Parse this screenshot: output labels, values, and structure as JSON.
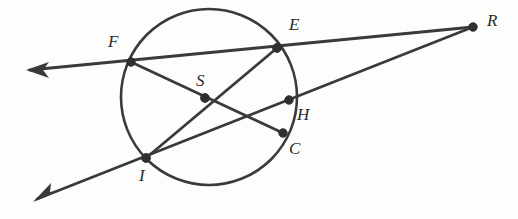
{
  "diagram": {
    "background_color": "#fdfdfc",
    "stroke_color": "#3a3a3a",
    "label_color": "#2b2b2b",
    "circle": {
      "name": "circle-S",
      "center_x": 209,
      "center_y": 97,
      "radius": 88
    },
    "points": [
      {
        "id": "F",
        "label": "F",
        "x": 131,
        "y": 62,
        "label_x": 108,
        "label_y": 33,
        "role": "circle-point"
      },
      {
        "id": "E",
        "label": "E",
        "x": 277,
        "y": 48,
        "label_x": 289,
        "label_y": 16,
        "role": "circle-point"
      },
      {
        "id": "R",
        "label": "R",
        "x": 473,
        "y": 27,
        "label_x": 487,
        "label_y": 12,
        "role": "external-point"
      },
      {
        "id": "S",
        "label": "S",
        "x": 205,
        "y": 98,
        "label_x": 196,
        "label_y": 72,
        "role": "intersection-point"
      },
      {
        "id": "H",
        "label": "H",
        "x": 289,
        "y": 100,
        "label_x": 297,
        "label_y": 106,
        "role": "circle-point"
      },
      {
        "id": "C",
        "label": "C",
        "x": 283,
        "y": 133,
        "label_x": 289,
        "label_y": 140,
        "role": "circle-point"
      },
      {
        "id": "I",
        "label": "I",
        "x": 146,
        "y": 158,
        "label_x": 139,
        "label_y": 167,
        "role": "circle-point"
      }
    ],
    "segments": [
      {
        "name": "secant-F-E-R",
        "from": "arrow-upper-left",
        "through": [
          "F",
          "E"
        ],
        "to": "R"
      },
      {
        "name": "secant-I-H-R",
        "from": "arrow-lower-left",
        "through": [
          "I",
          "H"
        ],
        "to": "R"
      },
      {
        "name": "chord-E-S-I",
        "from": "E",
        "through": [
          "S"
        ],
        "to": "I"
      },
      {
        "name": "chord-F-S-C",
        "from": "F",
        "through": [
          "S"
        ],
        "to": "C"
      }
    ],
    "arrows": [
      {
        "name": "arrow-upper-left",
        "tip_x": 26,
        "tip_y": 70,
        "angle_deg": 186
      },
      {
        "name": "arrow-lower-left",
        "tip_x": 33,
        "tip_y": 202,
        "angle_deg": 208
      }
    ]
  }
}
